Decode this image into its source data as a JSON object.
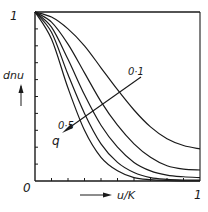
{
  "chart_data": {
    "type": "line",
    "title": "",
    "xlabel": "u/K",
    "ylabel": "dn u",
    "xlim": [
      0,
      1
    ],
    "ylim": [
      0,
      1
    ],
    "grid": false,
    "x_tick_labels": {
      "origin": "0",
      "max": "1"
    },
    "y_tick_labels": {
      "max": "1"
    },
    "parameter": {
      "name": "q",
      "arrow_label": "q",
      "labels": [
        "0·1",
        "0·5"
      ],
      "arrow_direction": "decreasing q toward lower-left"
    },
    "x": [
      0,
      0.1,
      0.2,
      0.3,
      0.4,
      0.5,
      0.6,
      0.7,
      0.8,
      0.9,
      1.0
    ],
    "series": [
      {
        "name": "q=0.1",
        "values": [
          1.0,
          0.97,
          0.9,
          0.8,
          0.67,
          0.54,
          0.42,
          0.32,
          0.25,
          0.21,
          0.19
        ]
      },
      {
        "name": "q=0.2",
        "values": [
          1.0,
          0.94,
          0.81,
          0.64,
          0.47,
          0.33,
          0.22,
          0.14,
          0.09,
          0.07,
          0.065
        ]
      },
      {
        "name": "q=0.3",
        "values": [
          1.0,
          0.91,
          0.72,
          0.51,
          0.33,
          0.2,
          0.11,
          0.06,
          0.035,
          0.025,
          0.02
        ]
      },
      {
        "name": "q=0.4",
        "values": [
          1.0,
          0.88,
          0.63,
          0.4,
          0.22,
          0.11,
          0.05,
          0.02,
          0.01,
          0.006,
          0.005
        ]
      },
      {
        "name": "q=0.5",
        "values": [
          1.0,
          0.84,
          0.55,
          0.3,
          0.14,
          0.06,
          0.02,
          0.008,
          0.003,
          0.001,
          0.0
        ]
      }
    ],
    "top_reference_line": {
      "name": "q=0",
      "value": 1.0
    }
  },
  "labels": {
    "y_axis": "dnu",
    "x_axis": "u/K",
    "origin": "0",
    "y_max": "1",
    "x_max": "1",
    "q_high": "0·1",
    "q_low": "0·5",
    "q": "q"
  }
}
